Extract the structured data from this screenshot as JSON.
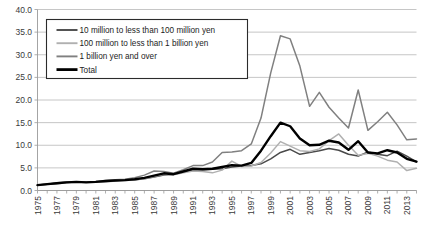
{
  "chart_data": {
    "type": "line",
    "title": "",
    "xlabel": "",
    "ylabel": "",
    "ylim": [
      0.0,
      40.0
    ],
    "ytick_labels": [
      "0.0",
      "5.0",
      "10.0",
      "15.0",
      "20.0",
      "25.0",
      "30.0",
      "35.0",
      "40.0"
    ],
    "ytick_values": [
      0.0,
      5.0,
      10.0,
      15.0,
      20.0,
      25.0,
      30.0,
      35.0,
      40.0
    ],
    "grid": true,
    "legend_position": "upper-left",
    "x": [
      1975,
      1976,
      1977,
      1978,
      1979,
      1980,
      1981,
      1982,
      1983,
      1984,
      1985,
      1986,
      1987,
      1988,
      1989,
      1990,
      1991,
      1992,
      1993,
      1994,
      1995,
      1996,
      1997,
      1998,
      1999,
      2000,
      2001,
      2002,
      2003,
      2004,
      2005,
      2006,
      2007,
      2008,
      2009,
      2010,
      2011,
      2012,
      2013,
      2014
    ],
    "xtick_labels": [
      "1975",
      "1977",
      "1979",
      "1981",
      "1983",
      "1985",
      "1987",
      "1989",
      "1991",
      "1993",
      "1995",
      "1997",
      "1999",
      "2001",
      "2003",
      "2005",
      "2007",
      "2009",
      "2011",
      "2013"
    ],
    "xtick_label_rotation": -90,
    "series": [
      {
        "name": "10 million to less than 100 million yen",
        "color": "#4a4a4a",
        "width": 1.5,
        "values": [
          1.2,
          1.4,
          1.6,
          1.8,
          1.9,
          1.8,
          1.8,
          2.0,
          2.2,
          2.3,
          2.4,
          2.6,
          3.0,
          3.4,
          3.6,
          4.1,
          4.6,
          4.6,
          4.7,
          4.8,
          5.2,
          5.4,
          5.5,
          5.9,
          7.0,
          8.4,
          9.1,
          8.0,
          8.4,
          8.8,
          9.3,
          8.9,
          8.0,
          7.6,
          8.5,
          8.0,
          7.7,
          8.7,
          7.6,
          6.3
        ]
      },
      {
        "name": "100 million to less than 1 billion yen",
        "color": "#b0b0b0",
        "width": 1.5,
        "values": [
          1.2,
          1.3,
          1.5,
          1.7,
          1.8,
          1.8,
          1.8,
          1.9,
          2.1,
          2.2,
          2.3,
          2.6,
          3.1,
          3.6,
          3.5,
          3.9,
          4.3,
          4.2,
          3.9,
          4.5,
          6.5,
          5.3,
          5.4,
          6.2,
          8.3,
          10.8,
          9.8,
          8.8,
          8.6,
          9.2,
          11.0,
          12.5,
          10.0,
          7.8,
          8.2,
          7.6,
          6.7,
          6.3,
          4.4,
          4.9
        ]
      },
      {
        "name": "1 billion yen and over",
        "color": "#808080",
        "width": 1.5,
        "values": [
          1.2,
          1.4,
          1.7,
          1.9,
          1.9,
          1.9,
          2.0,
          2.2,
          2.4,
          2.5,
          2.8,
          3.4,
          4.3,
          4.2,
          3.8,
          4.6,
          5.5,
          5.5,
          6.3,
          8.4,
          8.5,
          8.8,
          10.3,
          16.0,
          26.0,
          34.2,
          33.5,
          27.5,
          18.6,
          21.7,
          18.4,
          16.0,
          13.8,
          22.2,
          13.3,
          15.2,
          17.3,
          14.5,
          11.2,
          11.4
        ]
      },
      {
        "name": "Total",
        "color": "#000000",
        "width": 2.4,
        "values": [
          1.2,
          1.4,
          1.6,
          1.8,
          1.9,
          1.8,
          1.9,
          2.1,
          2.2,
          2.3,
          2.5,
          2.8,
          3.3,
          3.8,
          3.6,
          4.2,
          4.8,
          4.7,
          4.8,
          5.2,
          5.6,
          5.5,
          6.1,
          8.8,
          12.0,
          15.0,
          14.2,
          11.5,
          10.0,
          10.1,
          11.0,
          10.6,
          9.0,
          10.9,
          8.4,
          8.2,
          8.9,
          8.4,
          7.0,
          6.4
        ]
      }
    ]
  },
  "legend": {
    "entries": [
      {
        "label": "10 million to less than 100 million yen"
      },
      {
        "label": "100 million to less than 1 billion yen"
      },
      {
        "label": "1 billion yen and over"
      },
      {
        "label": "Total"
      }
    ]
  }
}
